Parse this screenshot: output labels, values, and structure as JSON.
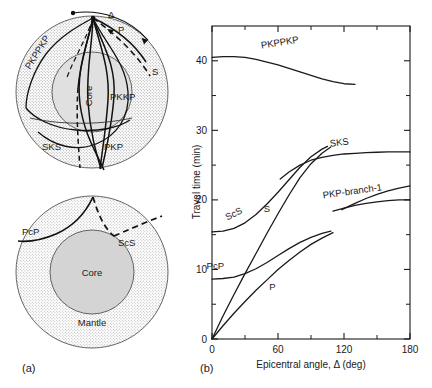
{
  "figure": {
    "panels": [
      {
        "tag": "(a)",
        "name": "ray-path-diagrams"
      },
      {
        "tag": "(b)",
        "name": "travel-time-curves"
      }
    ]
  },
  "panel_a": {
    "tag": "(a)",
    "upper_diagram": {
      "name": "whole-earth-core-phases",
      "center_label": "Core",
      "angle_symbol": "Δ",
      "ray_labels": [
        {
          "text": "P",
          "x": 119,
          "y": 31
        },
        {
          "text": "S",
          "x": 154,
          "y": 70
        },
        {
          "text": "PKPPKP",
          "x": 36,
          "y": 63,
          "rotate": -58
        },
        {
          "text": "PKKP",
          "x": 114,
          "y": 97
        },
        {
          "text": "SKS",
          "x": 52,
          "y": 143
        },
        {
          "text": "PKP",
          "x": 109,
          "y": 143
        }
      ]
    },
    "lower_diagram": {
      "name": "mantle-core-reflections",
      "center_label": "Core",
      "shell_label": "Mantle",
      "ray_labels": [
        {
          "text": "PcP",
          "x": 28,
          "y": 240
        },
        {
          "text": "ScS",
          "x": 112,
          "y": 243
        }
      ]
    }
  },
  "panel_b": {
    "tag": "(b)"
  },
  "chart_data": {
    "type": "line",
    "title": "",
    "xlabel": "Epicentral angle, Δ (deg)",
    "ylabel": "Travel time (min)",
    "xlim": [
      0,
      180
    ],
    "ylim": [
      0,
      45
    ],
    "xticks": [
      0,
      60,
      120,
      180
    ],
    "xticklabels": [
      "0",
      "60",
      "120",
      "180"
    ],
    "xminorticks": [
      30,
      90,
      150
    ],
    "yticks": [
      0,
      10,
      20,
      30,
      40
    ],
    "yticklabels": [
      "0",
      "10",
      "20",
      "30",
      "40"
    ],
    "yminorticks": [
      5,
      15,
      25,
      35
    ],
    "grid": false,
    "legend": "inline-curve-labels",
    "series": [
      {
        "name": "PKPPKP",
        "label_x": 62,
        "label_y": 42.2,
        "label_rotate": -9,
        "points": [
          [
            0,
            40.5
          ],
          [
            10,
            40.6
          ],
          [
            20,
            40.6
          ],
          [
            30,
            40.5
          ],
          [
            40,
            40.2
          ],
          [
            50,
            39.8
          ],
          [
            60,
            39.4
          ],
          [
            70,
            38.9
          ],
          [
            80,
            38.4
          ],
          [
            90,
            37.9
          ],
          [
            100,
            37.4
          ],
          [
            110,
            37.0
          ],
          [
            120,
            36.7
          ],
          [
            130,
            36.6
          ]
        ]
      },
      {
        "name": "SKS",
        "label_x": 116,
        "label_y": 27.8,
        "label_rotate": -7,
        "points": [
          [
            62,
            23.0
          ],
          [
            70,
            24.0
          ],
          [
            80,
            25.0
          ],
          [
            90,
            25.7
          ],
          [
            100,
            26.1
          ],
          [
            110,
            26.4
          ],
          [
            120,
            26.6
          ],
          [
            130,
            26.7
          ],
          [
            140,
            26.8
          ],
          [
            150,
            26.85
          ],
          [
            160,
            26.9
          ],
          [
            170,
            26.9
          ],
          [
            180,
            26.9
          ]
        ]
      },
      {
        "name": "ScS",
        "label_x": 21,
        "label_y": 17.6,
        "label_rotate": -26,
        "points": [
          [
            0,
            15.4
          ],
          [
            10,
            15.5
          ],
          [
            20,
            15.9
          ],
          [
            30,
            16.7
          ],
          [
            40,
            17.9
          ],
          [
            50,
            19.4
          ],
          [
            60,
            21.1
          ],
          [
            70,
            22.9
          ],
          [
            80,
            24.7
          ],
          [
            90,
            26.2
          ],
          [
            100,
            27.3
          ],
          [
            105,
            27.7
          ]
        ]
      },
      {
        "name": "S",
        "label_x": 50,
        "label_y": 18.2,
        "label_rotate": 0,
        "points": [
          [
            0,
            0
          ],
          [
            10,
            3.3
          ],
          [
            20,
            6.4
          ],
          [
            30,
            9.4
          ],
          [
            40,
            12.3
          ],
          [
            50,
            15.2
          ],
          [
            60,
            18.0
          ],
          [
            70,
            20.7
          ],
          [
            80,
            23.2
          ],
          [
            90,
            25.2
          ],
          [
            100,
            26.7
          ],
          [
            108,
            27.6
          ]
        ]
      },
      {
        "name": "PcP",
        "label_x": 3,
        "label_y": 10.1,
        "label_rotate": 0,
        "points": [
          [
            0,
            8.6
          ],
          [
            10,
            8.7
          ],
          [
            20,
            8.9
          ],
          [
            30,
            9.4
          ],
          [
            40,
            10.1
          ],
          [
            50,
            11.0
          ],
          [
            60,
            12.0
          ],
          [
            70,
            13.0
          ],
          [
            80,
            13.9
          ],
          [
            90,
            14.6
          ],
          [
            100,
            15.2
          ],
          [
            108,
            15.5
          ]
        ]
      },
      {
        "name": "P",
        "label_x": 55,
        "label_y": 7.0,
        "label_rotate": 0,
        "points": [
          [
            0,
            0
          ],
          [
            10,
            1.9
          ],
          [
            20,
            3.7
          ],
          [
            30,
            5.4
          ],
          [
            40,
            7.0
          ],
          [
            50,
            8.5
          ],
          [
            60,
            10.0
          ],
          [
            70,
            11.3
          ],
          [
            80,
            12.5
          ],
          [
            90,
            13.6
          ],
          [
            100,
            14.5
          ],
          [
            110,
            15.3
          ]
        ]
      },
      {
        "name": "PKP-branch-1",
        "label_x": 128,
        "label_y": 20.8,
        "label_rotate": -8,
        "points": [
          [
            110,
            18.4
          ],
          [
            120,
            18.8
          ],
          [
            130,
            19.2
          ],
          [
            140,
            19.5
          ],
          [
            150,
            19.7
          ],
          [
            160,
            19.9
          ],
          [
            170,
            20.0
          ],
          [
            180,
            20.0
          ]
        ]
      },
      {
        "name": "PKP-branch-2",
        "points": [
          [
            118,
            18.6
          ],
          [
            130,
            19.5
          ],
          [
            140,
            20.2
          ],
          [
            150,
            20.8
          ],
          [
            160,
            21.3
          ],
          [
            170,
            21.7
          ],
          [
            180,
            22.0
          ]
        ]
      }
    ]
  }
}
